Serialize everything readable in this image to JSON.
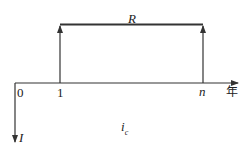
{
  "diagram": {
    "type": "cash-flow-diagram",
    "top_label": "R",
    "axis_unit": "年",
    "ticks": [
      "0",
      "1",
      "n"
    ],
    "down_arrow_label": "I",
    "rate_label": {
      "base": "i",
      "subscript": "c"
    },
    "colors": {
      "line": "#333333",
      "background": "#ffffff"
    }
  }
}
